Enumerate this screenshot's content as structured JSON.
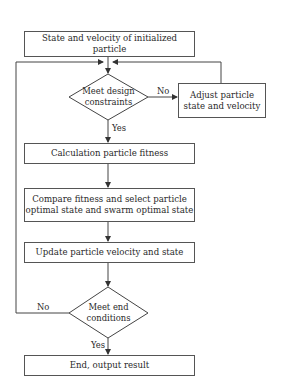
{
  "flowchart": {
    "nodes": {
      "init": {
        "type": "process",
        "label": "State and velocity of initialized particle"
      },
      "constraints": {
        "type": "decision",
        "line1": "Meet design",
        "line2": "constraints"
      },
      "adjust": {
        "type": "process",
        "line1": "Adjust particle",
        "line2": "state and velocity"
      },
      "fitness": {
        "type": "process",
        "label": "Calculation particle fitness"
      },
      "compare": {
        "type": "process",
        "line1": "Compare fitness and select particle",
        "line2": "optimal state and swarm optimal state"
      },
      "update": {
        "type": "process",
        "label": "Update particle velocity and state"
      },
      "end_check": {
        "type": "decision",
        "line1": "Meet end",
        "line2": "conditions"
      },
      "end": {
        "type": "terminal",
        "label": "End, output result"
      }
    },
    "edges": {
      "constraints_no": "No",
      "constraints_yes": "Yes",
      "end_no": "No",
      "end_yes": "Yes"
    }
  }
}
